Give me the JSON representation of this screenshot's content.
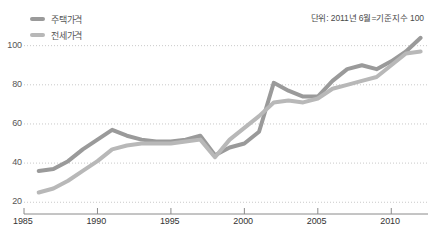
{
  "chart_data": {
    "type": "line",
    "title": "",
    "subtitle": "",
    "unit_note": "단위: 2011년 6월=기준지수 100",
    "xlabel": "",
    "ylabel": "",
    "xlim": [
      1985,
      2012.5
    ],
    "ylim": [
      14,
      108
    ],
    "grid": true,
    "grid_style": "dotted-horizontal",
    "legend_position": "top-left",
    "yticks": [
      20,
      40,
      60,
      80,
      100
    ],
    "ytick_labels": [
      "20",
      "40",
      "60",
      "80",
      "100"
    ],
    "xticks": [
      1985,
      1990,
      1995,
      2000,
      2005,
      2010
    ],
    "xtick_labels": [
      "1985",
      "1990",
      "1995",
      "2000",
      "2005",
      "2010"
    ],
    "x": [
      1986,
      1987,
      1988,
      1989,
      1990,
      1991,
      1992,
      1993,
      1994,
      1995,
      1996,
      1997,
      1998,
      1999,
      2000,
      2001,
      2002,
      2003,
      2004,
      2005,
      2006,
      2007,
      2008,
      2009,
      2010,
      2011,
      2012
    ],
    "series": [
      {
        "name": "주택가격",
        "color": "#9a9a9a",
        "values": [
          36,
          37,
          41,
          47,
          52,
          57,
          54,
          52,
          51,
          51,
          52,
          54,
          44,
          48,
          50,
          56,
          81,
          77,
          74,
          74,
          82,
          88,
          90,
          88,
          92,
          97,
          104
        ]
      },
      {
        "name": "전세가격",
        "color": "#b8b8b8",
        "values": [
          25,
          27,
          31,
          36,
          41,
          47,
          49,
          50,
          50,
          50,
          51,
          52,
          43,
          52,
          58,
          64,
          71,
          72,
          71,
          73,
          78,
          80,
          82,
          84,
          90,
          96,
          97
        ]
      }
    ]
  },
  "legend": {
    "items": [
      {
        "label": "주택가격",
        "color": "#9a9a9a"
      },
      {
        "label": "전세가격",
        "color": "#b8b8b8"
      }
    ]
  },
  "axis": {
    "y_labels": [
      "100",
      "80",
      "60",
      "40",
      "20"
    ],
    "x_labels": [
      "1985",
      "1990",
      "1995",
      "2000",
      "2005",
      "2010"
    ]
  },
  "colors": {
    "background": "#ffffff",
    "grid": "#c9c9c9",
    "axis": "#888888",
    "text": "#555555",
    "series_primary": "#9a9a9a",
    "series_secondary": "#b8b8b8"
  }
}
